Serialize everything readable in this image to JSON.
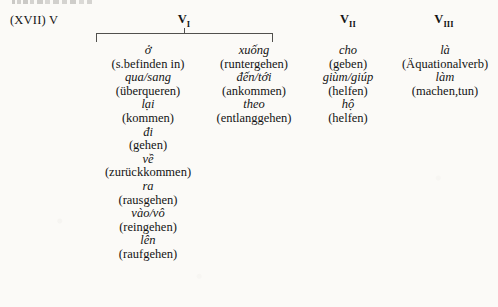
{
  "example": {
    "number_label": "(XVII) V"
  },
  "headers": [
    {
      "name": "V",
      "subscript": "I"
    },
    {
      "name": "V",
      "subscript": "II"
    },
    {
      "name": "V",
      "subscript": "III"
    }
  ],
  "columns": [
    {
      "id": "v1a",
      "entries": [
        {
          "word": "ở",
          "gloss": "(s.befinden in)"
        },
        {
          "word": "qua/sang",
          "gloss": "(überqueren)"
        },
        {
          "word": "lại",
          "gloss": "(kommen)"
        },
        {
          "word": "đi",
          "gloss": "(gehen)"
        },
        {
          "word": "về",
          "gloss": "(zurückkommen)"
        },
        {
          "word": "ra",
          "gloss": "(rausgehen)"
        },
        {
          "word": "vào/vô",
          "gloss": "(reingehen)"
        },
        {
          "word": "lên",
          "gloss": "(raufgehen)"
        }
      ]
    },
    {
      "id": "v1b",
      "entries": [
        {
          "word": "xuống",
          "gloss": "(runtergehen)"
        },
        {
          "word": "đến/tới",
          "gloss": "(ankommen)"
        },
        {
          "word": "theo",
          "gloss": "(entlanggehen)"
        }
      ]
    },
    {
      "id": "v2",
      "entries": [
        {
          "word": "cho",
          "gloss": "(geben)"
        },
        {
          "word": "giùm/giúp",
          "gloss": "(helfen)"
        },
        {
          "word": "hộ",
          "gloss": "(helfen)"
        }
      ]
    },
    {
      "id": "v3",
      "entries": [
        {
          "word": "là",
          "gloss": "(Äquationalverb)"
        },
        {
          "word": "làm",
          "gloss": "(machen,tun)"
        }
      ]
    }
  ]
}
